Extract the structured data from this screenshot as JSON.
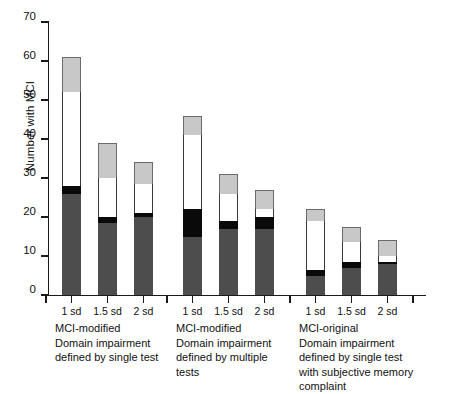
{
  "chart_data": {
    "type": "bar",
    "title": "",
    "subtitle": "",
    "xlabel": "",
    "ylabel": "Number with MCI",
    "ylim": [
      0,
      70
    ],
    "ytick_labels": [
      "0",
      "10",
      "20",
      "30",
      "40",
      "50",
      "60",
      "70"
    ],
    "yticks": [
      0,
      10,
      20,
      30,
      40,
      50,
      60,
      70
    ],
    "grid": false,
    "legend": "none",
    "stacked": true,
    "categories": [
      "1 sd",
      "1.5 sd",
      "2 sd",
      "1 sd",
      "1.5 sd",
      "2 sd",
      "1 sd",
      "1.5 sd",
      "2 sd"
    ],
    "groups": [
      {
        "caption": "MCI-modified\nDomain impairment\ndefined by single test",
        "bars": [
          {
            "label": "1 sd",
            "total": 61,
            "segments": {
              "dark_gray": 26,
              "black": 2,
              "white": 24,
              "light_gray": 9
            }
          },
          {
            "label": "1.5 sd",
            "total": 39,
            "segments": {
              "dark_gray": 18.5,
              "black": 1.5,
              "white": 10,
              "light_gray": 9
            }
          },
          {
            "label": "2 sd",
            "total": 34,
            "segments": {
              "dark_gray": 20,
              "black": 1,
              "white": 7.5,
              "light_gray": 5.5
            }
          }
        ]
      },
      {
        "caption": "MCI-modified\nDomain impairment\ndefined by multiple\ntests",
        "bars": [
          {
            "label": "1 sd",
            "total": 46,
            "segments": {
              "dark_gray": 15,
              "black": 7,
              "white": 19,
              "light_gray": 5
            }
          },
          {
            "label": "1.5 sd",
            "total": 31,
            "segments": {
              "dark_gray": 17,
              "black": 2,
              "white": 7,
              "light_gray": 5
            }
          },
          {
            "label": "2 sd",
            "total": 27,
            "segments": {
              "dark_gray": 17,
              "black": 3,
              "white": 2,
              "light_gray": 5
            }
          }
        ]
      },
      {
        "caption": "MCI-original\nDomain impairment\ndefined by single test\nwith subjective memory\ncomplaint",
        "bars": [
          {
            "label": "1 sd",
            "total": 22,
            "segments": {
              "dark_gray": 5,
              "black": 1.5,
              "white": 12.5,
              "light_gray": 3
            }
          },
          {
            "label": "1.5 sd",
            "total": 17.5,
            "segments": {
              "dark_gray": 7,
              "black": 1.5,
              "white": 5,
              "light_gray": 4
            }
          },
          {
            "label": "2 sd",
            "total": 14,
            "segments": {
              "dark_gray": 8,
              "black": 0.5,
              "white": 1.5,
              "light_gray": 4
            }
          }
        ]
      }
    ],
    "series": [
      {
        "name": "dark_gray",
        "color": "#4d4d4d",
        "values": [
          26,
          18.5,
          20,
          15,
          17,
          17,
          5,
          7,
          8
        ]
      },
      {
        "name": "black",
        "color": "#0a0a0a",
        "values": [
          2,
          1.5,
          1,
          7,
          2,
          3,
          1.5,
          1.5,
          0.5
        ]
      },
      {
        "name": "white",
        "color": "#ffffff",
        "values": [
          24,
          10,
          7.5,
          19,
          7,
          2,
          12.5,
          5,
          1.5
        ]
      },
      {
        "name": "light_gray",
        "color": "#c8c8c8",
        "values": [
          9,
          9,
          5.5,
          5,
          5,
          5,
          3,
          4,
          4
        ]
      }
    ],
    "totals": [
      61,
      39,
      34,
      46,
      31,
      27,
      22,
      17.5,
      14
    ]
  },
  "axis": {
    "y_title": "Number with MCI"
  }
}
